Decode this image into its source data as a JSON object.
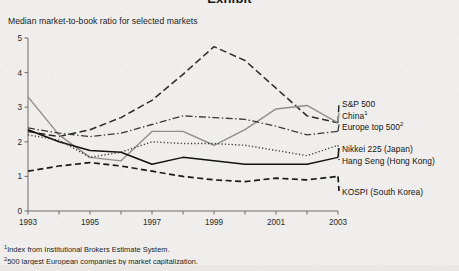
{
  "page": {
    "clipped_heading": "Exhibit",
    "subtitle": "Median market-to-book ratio for selected markets",
    "background_color": "#efeeec"
  },
  "footnotes": [
    {
      "marker": "1",
      "text": "Index from Institutional Brokers Estimate System."
    },
    {
      "marker": "2",
      "text": "500 largest European companies by market capitalization."
    }
  ],
  "legend": [
    {
      "label": "S&P 500",
      "marker": "",
      "style": "long-dash",
      "color": "#2b2b2b"
    },
    {
      "label": "China",
      "marker": "1",
      "style": "solid-gray",
      "color": "#8c8c8c"
    },
    {
      "label": "Europe top 500",
      "marker": "2",
      "style": "dash-dot",
      "color": "#3a3a3a"
    },
    {
      "label": "Nikkei 225 (Japan)",
      "marker": "",
      "style": "solid-black",
      "color": "#111111"
    },
    {
      "label": "Hang Seng (Hong Kong)",
      "marker": "",
      "style": "dotted",
      "color": "#3a3a3a"
    },
    {
      "label": "KOSPI (South Korea)",
      "marker": "",
      "style": "med-dash",
      "color": "#1a1a1a"
    }
  ],
  "chart_data": {
    "type": "line",
    "title": "Median market-to-book ratio for selected markets",
    "xlabel": "",
    "ylabel": "",
    "x": [
      1993,
      1994,
      1995,
      1996,
      1997,
      1998,
      1999,
      2000,
      2001,
      2002,
      2003
    ],
    "xlim": [
      1993,
      2003
    ],
    "ylim": [
      0,
      5
    ],
    "yticks": [
      0,
      1,
      2,
      3,
      4,
      5
    ],
    "xticks_labeled": [
      1993,
      1995,
      1997,
      1999,
      2001,
      2003
    ],
    "grid": false,
    "legend_position": "right",
    "series": [
      {
        "name": "S&P 500",
        "values": [
          2.3,
          2.15,
          2.35,
          2.7,
          3.2,
          3.95,
          4.75,
          4.35,
          3.55,
          2.75,
          2.55
        ]
      },
      {
        "name": "China",
        "values": [
          3.3,
          2.2,
          1.55,
          1.45,
          2.3,
          2.3,
          1.9,
          2.35,
          2.95,
          3.05,
          2.55
        ]
      },
      {
        "name": "Europe top 500",
        "values": [
          2.4,
          2.25,
          2.15,
          2.25,
          2.5,
          2.75,
          2.7,
          2.65,
          2.45,
          2.2,
          2.3
        ]
      },
      {
        "name": "Nikkei 225 (Japan)",
        "values": [
          2.35,
          2.0,
          1.75,
          1.7,
          1.35,
          1.55,
          1.45,
          1.35,
          1.35,
          1.35,
          1.55
        ]
      },
      {
        "name": "Hang Seng (Hong Kong)",
        "values": [
          2.2,
          2.05,
          1.55,
          1.7,
          2.0,
          1.95,
          1.95,
          1.9,
          1.75,
          1.6,
          1.9
        ]
      },
      {
        "name": "KOSPI (South Korea)",
        "values": [
          1.15,
          1.3,
          1.4,
          1.3,
          1.15,
          1.0,
          0.9,
          0.85,
          0.95,
          0.9,
          1.0
        ]
      }
    ]
  },
  "axis": {
    "y_tick_labels": [
      "0",
      "1",
      "2",
      "3",
      "4",
      "5"
    ],
    "x_tick_labels": [
      "1993",
      "1995",
      "1997",
      "1999",
      "2001",
      "2003"
    ]
  }
}
